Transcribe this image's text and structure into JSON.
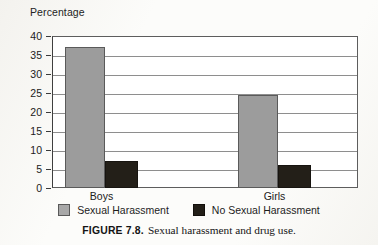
{
  "figure": {
    "number_label": "FIGURE 7.8.",
    "caption_text": "Sexual harassment and drug use."
  },
  "legend": {
    "items": [
      {
        "label": "Sexual Harassment",
        "swatch": "gray-swatch-icon",
        "color": "#9c9c9c"
      },
      {
        "label": "No Sexual Harassment",
        "swatch": "black-swatch-icon",
        "color": "#231f18"
      }
    ]
  },
  "chart_data": {
    "type": "bar",
    "title": "",
    "xlabel": "",
    "ylabel": "Percentage",
    "ylim": [
      0,
      40
    ],
    "ytick_step": 5,
    "yticks": [
      40,
      35,
      30,
      25,
      20,
      15,
      10,
      5,
      0
    ],
    "grid": true,
    "legend_position": "bottom",
    "categories": [
      "Boys",
      "Girls"
    ],
    "series": [
      {
        "name": "Sexual Harassment",
        "color": "#9c9c9c",
        "values": [
          37,
          24.5
        ]
      },
      {
        "name": "No Sexual Harassment",
        "color": "#231f18",
        "values": [
          7,
          6
        ]
      }
    ]
  }
}
